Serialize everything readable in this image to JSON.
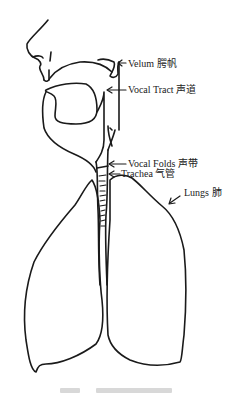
{
  "diagram": {
    "labels": [
      {
        "id": "velum",
        "text": "Velum 腭帆",
        "x": 128,
        "y": 58
      },
      {
        "id": "vocal-tract",
        "text": "Vocal Tract 声道",
        "x": 128,
        "y": 84
      },
      {
        "id": "vocal-folds",
        "text": "Vocal Folds 声带",
        "x": 128,
        "y": 157
      },
      {
        "id": "trachea",
        "text": "Trachea 气管",
        "x": 121,
        "y": 168
      },
      {
        "id": "lungs",
        "text": "Lungs 肺",
        "x": 183,
        "y": 187
      }
    ],
    "colors": {
      "line": "#1a1a1a",
      "text": "#222222",
      "background": "#ffffff"
    }
  }
}
